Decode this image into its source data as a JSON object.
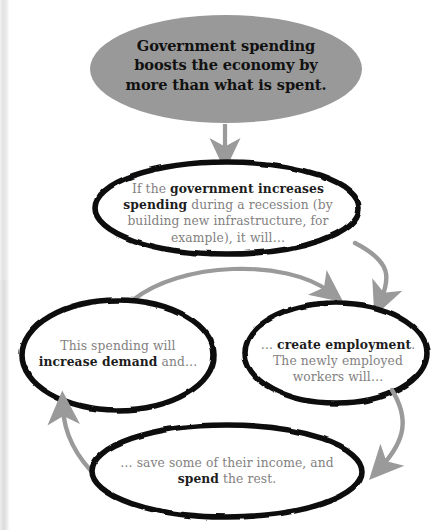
{
  "diagram": {
    "type": "cycle-flowchart",
    "title_node": {
      "id": "thesis",
      "shape": "ellipse",
      "fill": "#999999",
      "text_lines": [
        "Government spending",
        "boosts the economy by",
        "more than what is spent."
      ]
    },
    "nodes": [
      {
        "id": "node-government-spending",
        "shape": "ellipse",
        "fill": "#ffffff",
        "stroke": "#111111",
        "segments": [
          {
            "text": "If the ",
            "bold": false
          },
          {
            "text": "government increases spending",
            "bold": true
          },
          {
            "text": " during a recession (by building new infrastructure, for example), it will…",
            "bold": false
          }
        ]
      },
      {
        "id": "node-increase-demand",
        "shape": "ellipse",
        "fill": "#ffffff",
        "stroke": "#111111",
        "segments": [
          {
            "text": "This spending will ",
            "bold": false
          },
          {
            "text": "increase demand",
            "bold": true
          },
          {
            "text": " and…",
            "bold": false
          }
        ]
      },
      {
        "id": "node-create-employment",
        "shape": "ellipse",
        "fill": "#ffffff",
        "stroke": "#111111",
        "segments": [
          {
            "text": "… ",
            "bold": false
          },
          {
            "text": "create employment",
            "bold": true
          },
          {
            "text": ". The newly employed workers will…",
            "bold": false
          }
        ]
      },
      {
        "id": "node-save-and-spend",
        "shape": "ellipse",
        "fill": "#ffffff",
        "stroke": "#111111",
        "segments": [
          {
            "text": "… save some of their income, and ",
            "bold": false
          },
          {
            "text": "spend",
            "bold": true
          },
          {
            "text": " the rest.",
            "bold": false
          }
        ]
      }
    ],
    "arrows": [
      {
        "id": "arrow-thesis-to-spending",
        "from": "thesis",
        "to": "node-government-spending",
        "color": "#9a9a9a",
        "style": "straight-down"
      },
      {
        "id": "arrow-spending-to-employment",
        "from": "node-government-spending",
        "to": "node-create-employment",
        "color": "#9a9a9a",
        "style": "curve-right-down"
      },
      {
        "id": "arrow-demand-to-employment",
        "from": "node-increase-demand",
        "to": "node-create-employment",
        "color": "#9a9a9a",
        "style": "arc-over-right"
      },
      {
        "id": "arrow-employment-to-spend",
        "from": "node-create-employment",
        "to": "node-save-and-spend",
        "color": "#9a9a9a",
        "style": "curve-down-left"
      },
      {
        "id": "arrow-spend-to-demand",
        "from": "node-save-and-spend",
        "to": "node-increase-demand",
        "color": "#9a9a9a",
        "style": "curve-up-left"
      }
    ],
    "colors": {
      "title_fill": "#999999",
      "node_fill": "#ffffff",
      "node_stroke": "#111111",
      "arrow": "#9a9a9a",
      "body_text": "#83817f",
      "emphasis_text": "#1d1d1d",
      "background": "#ffffff"
    }
  }
}
